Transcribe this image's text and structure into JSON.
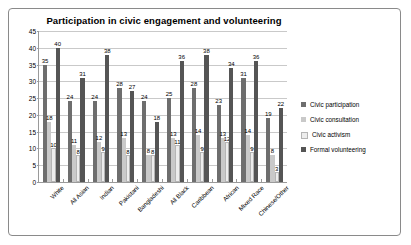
{
  "chart_data": {
    "type": "bar",
    "title": "Participation in civic engagement and volunteering",
    "xlabel": "",
    "ylabel": "",
    "ylim": [
      0,
      45
    ],
    "yticks": [
      0,
      5,
      10,
      15,
      20,
      25,
      30,
      35,
      40,
      45
    ],
    "grid": true,
    "legend_position": "right",
    "categories": [
      "White",
      "All Asian",
      "Indian",
      "Pakistani",
      "Bangladeshi",
      "All Black",
      "Caribbean",
      "African",
      "Mixed Race",
      "Chinese/Other"
    ],
    "series": [
      {
        "name": "Civic participation",
        "color": "#6e6e6e",
        "values": [
          35,
          24,
          24,
          28,
          24,
          25,
          28,
          23,
          31,
          19
        ]
      },
      {
        "name": "Civic consultation",
        "color": "#c9c9c9",
        "values": [
          18,
          11,
          12,
          13,
          8,
          13,
          14,
          13,
          14,
          8
        ]
      },
      {
        "name": "Civic activism",
        "color": "#ededed",
        "values": [
          10,
          8,
          9,
          8,
          8,
          11,
          9,
          12,
          9,
          3
        ]
      },
      {
        "name": "Formal volunteering",
        "color": "#555555",
        "values": [
          40,
          31,
          38,
          27,
          18,
          36,
          38,
          34,
          36,
          22
        ]
      }
    ]
  }
}
